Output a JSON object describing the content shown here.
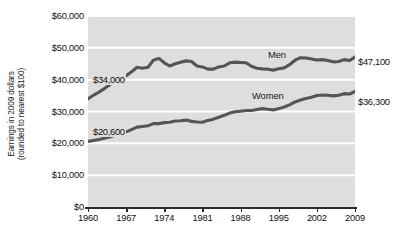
{
  "chart_data": {
    "type": "line",
    "title": "",
    "xlabel": "",
    "ylabel": "Earnings in 2009 dollars (rounded to nearest $100)",
    "ylabel_line1": "Earnings in 2009 dollars",
    "ylabel_line2": "(rounded to nearest $100)",
    "xlim": [
      1960,
      2009
    ],
    "ylim": [
      0,
      60000
    ],
    "grid": true,
    "legend_position": "inline-labels",
    "y_ticks": [
      {
        "value": 0,
        "label": "$0"
      },
      {
        "value": 10000,
        "label": "$10,000"
      },
      {
        "value": 20000,
        "label": "$20,000"
      },
      {
        "value": 30000,
        "label": "$30,000"
      },
      {
        "value": 40000,
        "label": "$40,000"
      },
      {
        "value": 50000,
        "label": "$50,000"
      },
      {
        "value": 60000,
        "label": "$60,000"
      }
    ],
    "x_ticks": [
      {
        "value": 1960,
        "label": "1960"
      },
      {
        "value": 1967,
        "label": "1967"
      },
      {
        "value": 1974,
        "label": "1974"
      },
      {
        "value": 1981,
        "label": "1981"
      },
      {
        "value": 1988,
        "label": "1988"
      },
      {
        "value": 1995,
        "label": "1995"
      },
      {
        "value": 2002,
        "label": "2002"
      },
      {
        "value": 2009,
        "label": "2009"
      }
    ],
    "x": [
      1960,
      1961,
      1962,
      1963,
      1964,
      1965,
      1966,
      1967,
      1968,
      1969,
      1970,
      1971,
      1972,
      1973,
      1974,
      1975,
      1976,
      1977,
      1978,
      1979,
      1980,
      1981,
      1982,
      1983,
      1984,
      1985,
      1986,
      1987,
      1988,
      1989,
      1990,
      1991,
      1992,
      1993,
      1994,
      1995,
      1996,
      1997,
      1998,
      1999,
      2000,
      2001,
      2002,
      2003,
      2004,
      2005,
      2006,
      2007,
      2008,
      2009
    ],
    "series": [
      {
        "name": "Men",
        "label": "Men",
        "color": "#555555",
        "start_label": "$34,000",
        "end_label": "$47,100",
        "start_value": 34000,
        "end_value": 47100,
        "values": [
          34000,
          35100,
          36100,
          37200,
          38400,
          39600,
          40700,
          41200,
          42500,
          43900,
          43600,
          43900,
          46100,
          46700,
          45300,
          44300,
          45000,
          45500,
          45900,
          45700,
          44300,
          44000,
          43300,
          43300,
          44000,
          44300,
          45300,
          45500,
          45400,
          45300,
          44200,
          43600,
          43400,
          43300,
          43000,
          43400,
          43700,
          44700,
          46100,
          46900,
          46800,
          46500,
          46200,
          46300,
          46000,
          45600,
          45700,
          46300,
          46000,
          47100
        ]
      },
      {
        "name": "Women",
        "label": "Women",
        "color": "#555555",
        "start_label": "$20,600",
        "end_label": "$36,300",
        "start_value": 20600,
        "end_value": 36300,
        "values": [
          20600,
          20900,
          21200,
          21600,
          22000,
          22600,
          23000,
          23600,
          24300,
          25100,
          25300,
          25500,
          26200,
          26200,
          26500,
          26600,
          27000,
          27100,
          27300,
          26900,
          26700,
          26600,
          27200,
          27600,
          28200,
          28800,
          29500,
          29900,
          30100,
          30300,
          30300,
          30600,
          30900,
          30700,
          30500,
          30900,
          31400,
          32100,
          33000,
          33600,
          34100,
          34500,
          35000,
          35200,
          35100,
          34900,
          35100,
          35600,
          35500,
          36300
        ]
      }
    ]
  }
}
